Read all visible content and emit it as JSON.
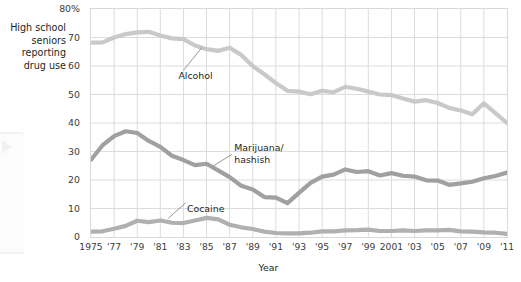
{
  "caption": {
    "lines": [
      "High school",
      "seniors",
      "reporting",
      "drug use"
    ]
  },
  "axis": {
    "x_title": "Year"
  },
  "labels": {
    "alcohol": "Alcohol",
    "marijuana_line1": "Marijuana/",
    "marijuana_line2": "hashish",
    "cocaine": "Cocaine"
  },
  "colors": {
    "alcohol": "#c9c9c9",
    "marijuana": "#a0a0a0",
    "cocaine": "#b0b0b0",
    "grid": "#dcdcdc",
    "frame": "#d9d9d9",
    "text": "#231f20"
  },
  "chart_data": {
    "type": "line",
    "title": "High school seniors reporting drug use",
    "xlabel": "Year",
    "ylabel": "",
    "xlim": [
      1975,
      2011
    ],
    "ylim": [
      0,
      80
    ],
    "yticks": [
      0,
      10,
      20,
      30,
      40,
      50,
      60,
      70,
      80
    ],
    "ytick_labels": [
      "0",
      "10",
      "20",
      "30",
      "40",
      "50",
      "60",
      "70",
      "80%"
    ],
    "xticks": [
      1975,
      1977,
      1979,
      1981,
      1983,
      1985,
      1987,
      1989,
      1991,
      1993,
      1995,
      1997,
      1999,
      2001,
      2003,
      2005,
      2007,
      2009,
      2011
    ],
    "xtick_labels": [
      "1975",
      "'77",
      "'79",
      "'81",
      "'83",
      "'85",
      "'87",
      "'89",
      "'91",
      "'93",
      "'95",
      "'97",
      "'99",
      "2001",
      "'03",
      "'05",
      "'07",
      "'09",
      "'11"
    ],
    "grid": true,
    "legend": "inline-annotations",
    "x": [
      1975,
      1976,
      1977,
      1978,
      1979,
      1980,
      1981,
      1982,
      1983,
      1984,
      1985,
      1986,
      1987,
      1988,
      1989,
      1990,
      1991,
      1992,
      1993,
      1994,
      1995,
      1996,
      1997,
      1998,
      1999,
      2000,
      2001,
      2002,
      2003,
      2004,
      2005,
      2006,
      2007,
      2008,
      2009,
      2010,
      2011
    ],
    "series": [
      {
        "name": "Alcohol",
        "color": "#c9c9c9",
        "values": [
          68.2,
          68.3,
          70.0,
          71.2,
          71.8,
          72.0,
          70.7,
          69.7,
          69.4,
          67.2,
          65.9,
          65.3,
          66.4,
          63.9,
          60.0,
          57.1,
          54.0,
          51.3,
          51.0,
          50.1,
          51.3,
          50.8,
          52.7,
          52.0,
          51.0,
          50.0,
          49.8,
          48.6,
          47.5,
          48.0,
          47.0,
          45.3,
          44.4,
          43.1,
          46.9,
          43.5,
          40.0
        ]
      },
      {
        "name": "Marijuana/hashish",
        "color": "#a0a0a0",
        "values": [
          27.1,
          32.2,
          35.4,
          37.1,
          36.5,
          33.7,
          31.6,
          28.5,
          27.0,
          25.2,
          25.7,
          23.4,
          21.0,
          18.0,
          16.7,
          14.0,
          13.8,
          11.9,
          15.5,
          19.0,
          21.2,
          21.9,
          23.7,
          22.8,
          23.1,
          21.6,
          22.4,
          21.5,
          21.2,
          19.9,
          19.8,
          18.3,
          18.8,
          19.4,
          20.6,
          21.4,
          22.6
        ]
      },
      {
        "name": "Cocaine",
        "color": "#b0b0b0",
        "values": [
          1.9,
          2.0,
          2.9,
          3.9,
          5.7,
          5.2,
          5.8,
          5.0,
          4.9,
          5.8,
          6.7,
          6.2,
          4.3,
          3.4,
          2.8,
          1.9,
          1.4,
          1.3,
          1.3,
          1.5,
          2.0,
          2.0,
          2.3,
          2.4,
          2.6,
          2.1,
          2.1,
          2.3,
          2.1,
          2.3,
          2.3,
          2.5,
          2.0,
          1.9,
          1.6,
          1.5,
          1.1
        ]
      }
    ],
    "annotations": [
      {
        "text": "Alcohol",
        "anchor_x": 1983,
        "anchor_y": 57
      },
      {
        "text": "Marijuana/hashish",
        "anchor_x": 1987,
        "anchor_y": 30
      },
      {
        "text": "Cocaine",
        "anchor_x": 1983,
        "anchor_y": 12
      }
    ]
  }
}
